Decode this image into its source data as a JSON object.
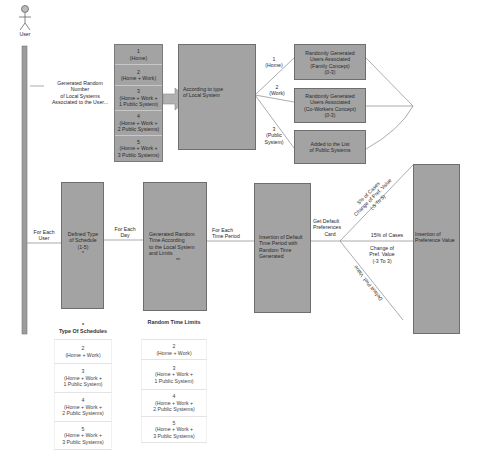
{
  "actor": {
    "label": "User"
  },
  "top_flow": {
    "note": [
      "Generated Random",
      "Number",
      "of Local Systems",
      "Associated to the User..."
    ],
    "system_counts": [
      {
        "num": "1",
        "desc": [
          "(Home)"
        ]
      },
      {
        "num": "2",
        "desc": [
          "(Home + Work)"
        ]
      },
      {
        "num": "3",
        "desc": [
          "(Home + Work +",
          "1 Public System)"
        ]
      },
      {
        "num": "4",
        "desc": [
          "(Home + Work +",
          "2 Public Systems)"
        ]
      },
      {
        "num": "5",
        "desc": [
          "(Home + Work +",
          "3 Public Systems)"
        ]
      }
    ],
    "decision_box": [
      "According to type",
      "of Local System"
    ],
    "branches": [
      {
        "label": [
          "1",
          "(Home)"
        ],
        "target": [
          "Randomly Generated",
          "Users Associated",
          "(Family Concept)",
          "(0-3)"
        ]
      },
      {
        "label": [
          "2",
          "(Work)"
        ],
        "target": [
          "Randomly Generated",
          "Users Associated",
          "(Co-Workers Concept)",
          "(0-3)"
        ]
      },
      {
        "label": [
          "3",
          "(Public",
          "System)"
        ],
        "target": [
          "Added to the List",
          "of Public Systems"
        ]
      }
    ]
  },
  "bottom_flow": {
    "edge_for_each_user": [
      "For Each",
      "User"
    ],
    "schedule_box": [
      "Defined Type",
      "of Schedule",
      "(1-5)",
      "*"
    ],
    "edge_for_each_day": [
      "For Each",
      "Day"
    ],
    "random_time_box": [
      "Generated Random",
      "Time According",
      "to the Local System",
      "and Limits",
      "**"
    ],
    "edge_for_each_period": [
      "For Each",
      "Time Period"
    ],
    "insertion_box": [
      "Insertion of Default",
      "Time Period with",
      "Random Time",
      "Generated"
    ],
    "edge_get_default": [
      "Get Default",
      "Preferences",
      "Card"
    ],
    "branch_upper": [
      "5% of Cases",
      "Change of Pref. Value",
      "(-5 To 5)"
    ],
    "branch_middle_top": "15% of Cases",
    "branch_middle_bottom": [
      "Change of",
      "Pref. Value",
      "(-3 To 3)"
    ],
    "branch_lower": "Default Pref. Value",
    "final_box": [
      "Insertion of",
      "Preference Value"
    ]
  },
  "tables": {
    "schedule_types": {
      "marker": "*",
      "title": "Type Of Schedules",
      "rows": [
        [
          "2",
          "(Home + Work)"
        ],
        [
          "3",
          "(Home + Work +",
          "1 Public System)"
        ],
        [
          "4",
          "(Home + Work +",
          "2 Public Systems)"
        ],
        [
          "5",
          "(Home + Work +",
          "3 Public Systems)"
        ]
      ]
    },
    "random_time_limits": {
      "title": "Random Time Limits",
      "rows": [
        [
          "2",
          "(Home + Work)"
        ],
        [
          "3",
          "(Home + Work +",
          "1 Public System)"
        ],
        [
          "4",
          "(Home + Work +",
          "2 Public Systems)"
        ],
        [
          "5",
          "(Home + Work +",
          "3 Public Systems)"
        ]
      ]
    }
  },
  "colors": {
    "box_fill": "#a3a3a3",
    "box_border": "#6e6e6e",
    "line": "#7a7a7a",
    "lifeline": "#9a9a9a"
  }
}
